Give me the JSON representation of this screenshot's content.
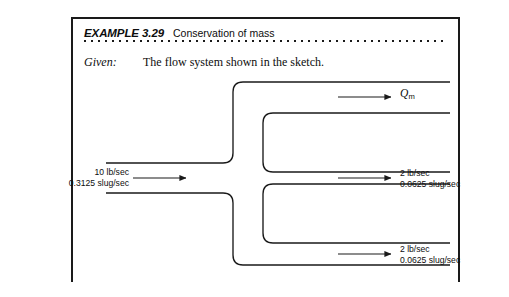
{
  "example": {
    "tag": "EXAMPLE 3.29",
    "title": "Conservation of mass"
  },
  "given": {
    "label": "Given:",
    "text": "The flow system shown in the sketch."
  },
  "sketch": {
    "inlet": {
      "name": "inlet-flow",
      "line1": "10 lb/sec",
      "line2": "0.3125 slug/sec"
    },
    "outlet_top": {
      "name": "top-outlet-flow",
      "symbol": "Q",
      "subscript": "m"
    },
    "outlet_middle": {
      "name": "middle-outlet-flow",
      "line1": "2 lb/sec",
      "line2": "0.0625 slug/sec"
    },
    "outlet_bottom": {
      "name": "bottom-outlet-flow",
      "line1": "2 lb/sec",
      "line2": "0.0625 slug/sec"
    }
  },
  "colors": {
    "ink": "#1a1a1a",
    "page": "#ffffff"
  }
}
